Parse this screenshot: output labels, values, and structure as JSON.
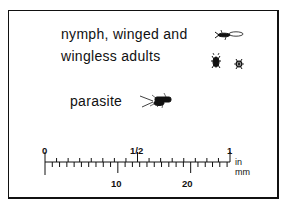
{
  "legend": {
    "line1": "nymph, winged and",
    "line2": "wingless adults",
    "parasite": "parasite"
  },
  "icons": [
    "winged-adult-icon",
    "nymph-icon",
    "wingless-adult-icon",
    "parasite-wasp-icon"
  ],
  "scale": {
    "inch_labels": [
      "0",
      "1/2",
      "1"
    ],
    "mm_labels": [
      "10",
      "20"
    ],
    "unit_in": "in",
    "unit_mm": "mm"
  }
}
